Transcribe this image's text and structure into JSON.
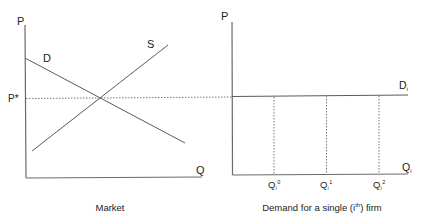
{
  "colors": {
    "line": "#5a5a5a",
    "axis": "#6a6a6a",
    "dotted": "#7a7a7a",
    "text": "#222222",
    "background": "#ffffff"
  },
  "market_panel": {
    "title": "Market",
    "y_axis_label": "P",
    "x_axis_label": "Q",
    "demand_label": "D",
    "supply_label": "S",
    "equilibrium_price_label": "P*"
  },
  "firm_panel": {
    "title_prefix": "Demand for a single (i",
    "title_sup": "th",
    "title_suffix": ") firm",
    "y_axis_label": "P",
    "x_axis_label": "Q",
    "x_axis_sub": "i",
    "demand_label": "D",
    "demand_sub": "i",
    "quantities": [
      {
        "base": "Q",
        "sub": "i",
        "sup": "0"
      },
      {
        "base": "Q",
        "sub": "i",
        "sup": "1"
      },
      {
        "base": "Q",
        "sub": "i",
        "sup": "2"
      }
    ]
  }
}
